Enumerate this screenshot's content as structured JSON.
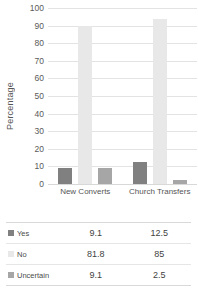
{
  "chart_data": {
    "type": "bar",
    "title": "",
    "xlabel": "",
    "ylabel": "Percentage",
    "categories": [
      "New Converts",
      "Church Transfers"
    ],
    "series": [
      {
        "name": "Yes",
        "values": [
          9.1,
          12.5
        ],
        "color": "#808080"
      },
      {
        "name": "No",
        "values": [
          81.8,
          85
        ],
        "color": "#e8e8e8"
      },
      {
        "name": "Uncertain",
        "values": [
          9.1,
          2.5
        ],
        "color": "#a6a6a6"
      }
    ],
    "ylim": [
      0,
      100
    ],
    "yticks": [
      0,
      10,
      20,
      30,
      40,
      50,
      60,
      70,
      80,
      90,
      100
    ],
    "ytick_labels": [
      "0",
      "10",
      "20",
      "30",
      "40",
      "50",
      "60",
      "70",
      "80",
      "90",
      "100"
    ],
    "grid": true,
    "legend_position": "table-below",
    "bar_render_heights": [
      {
        "series": "Yes",
        "values": [
          9.1,
          12.5
        ]
      },
      {
        "series": "No",
        "values": [
          90,
          94
        ]
      },
      {
        "series": "Uncertain",
        "values": [
          9.1,
          2.5
        ]
      }
    ]
  },
  "axis": {
    "y_label": "Percentage",
    "y_ticks": [
      "100",
      "90",
      "80",
      "70",
      "60",
      "50",
      "40",
      "30",
      "20",
      "10",
      "0"
    ],
    "x_categories": [
      "New Converts",
      "Church Transfers"
    ]
  },
  "table": {
    "rows": [
      {
        "label": "Yes",
        "swatch": "#808080",
        "values": [
          "9.1",
          "12.5"
        ]
      },
      {
        "label": "No",
        "swatch": "#e8e8e8",
        "values": [
          "81.8",
          "85"
        ]
      },
      {
        "label": "Uncertain",
        "swatch": "#a6a6a6",
        "values": [
          "9.1",
          "2.5"
        ]
      }
    ]
  }
}
